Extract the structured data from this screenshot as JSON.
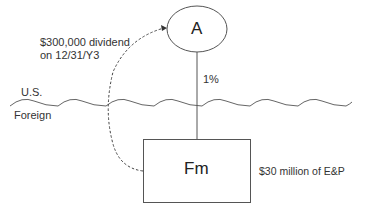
{
  "diagram": {
    "nodes": {
      "a": {
        "label": "A"
      },
      "fm": {
        "label": "Fm",
        "note": "$30 million of E&P"
      }
    },
    "edge_ownership": {
      "label": "1%"
    },
    "dividend_arrow": {
      "line1": "$300,000 dividend",
      "line2": "on 12/31/Y3"
    },
    "border": {
      "upper_label": "U.S.",
      "lower_label": "Foreign"
    },
    "colors": {
      "stroke": "#555555",
      "text": "#333333"
    }
  }
}
